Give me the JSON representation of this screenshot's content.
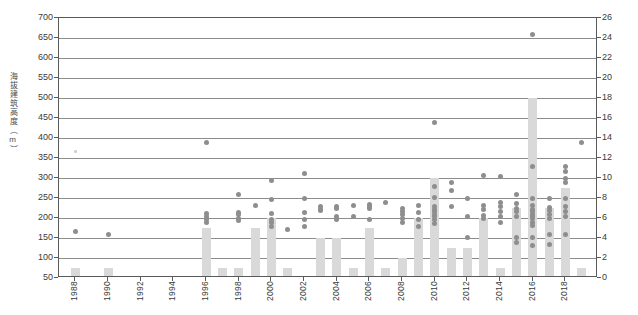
{
  "chart_data": {
    "type": "scatter",
    "title": "",
    "ylabel": "海拔建筑高度（m）",
    "ylabel_right": "",
    "xlabel": "",
    "ylim": [
      50,
      700
    ],
    "ytick_step": 50,
    "yticks": [
      50,
      100,
      150,
      200,
      250,
      300,
      350,
      400,
      450,
      500,
      550,
      600,
      650,
      700
    ],
    "ylim_right": [
      0,
      26
    ],
    "ytick_step_right": 2,
    "yticks_right": [
      0,
      2,
      4,
      6,
      8,
      10,
      12,
      14,
      16,
      18,
      20,
      22,
      24,
      26
    ],
    "xlim": [
      1987,
      2020
    ],
    "xticks": [
      1988,
      1990,
      1992,
      1994,
      1996,
      1998,
      2000,
      2002,
      2004,
      2006,
      2008,
      2010,
      2012,
      2014,
      2016,
      2018
    ],
    "grid": true,
    "legend": false,
    "bar_color": "#d9d9d9",
    "dot_color": "#8e8e8e",
    "series": [
      {
        "name": "建筑数量",
        "type": "bar",
        "axis": "right",
        "x": [
          1988,
          1990,
          1996,
          1997,
          1998,
          1999,
          2000,
          2001,
          2003,
          2004,
          2005,
          2006,
          2007,
          2008,
          2009,
          2010,
          2011,
          2012,
          2013,
          2014,
          2015,
          2016,
          2017,
          2018,
          2019
        ],
        "values": [
          1,
          1,
          5,
          1,
          1,
          5,
          6,
          1,
          4,
          4,
          1,
          5,
          1,
          2,
          6,
          10,
          3,
          3,
          6,
          1,
          7,
          18,
          7,
          9,
          1
        ]
      },
      {
        "name": "建筑高度",
        "type": "scatter",
        "axis": "left",
        "points": [
          [
            1988,
            166
          ],
          [
            1988,
            366
          ],
          [
            1990,
            160
          ],
          [
            1996,
            388
          ],
          [
            1996,
            212
          ],
          [
            1996,
            205
          ],
          [
            1996,
            196
          ],
          [
            1996,
            188
          ],
          [
            1998,
            260
          ],
          [
            1998,
            215
          ],
          [
            1998,
            208
          ],
          [
            1998,
            200
          ],
          [
            1998,
            193
          ],
          [
            1999,
            232
          ],
          [
            2000,
            295
          ],
          [
            2000,
            247
          ],
          [
            2000,
            212
          ],
          [
            2000,
            196
          ],
          [
            2000,
            188
          ],
          [
            2000,
            180
          ],
          [
            2001,
            172
          ],
          [
            2002,
            312
          ],
          [
            2002,
            248
          ],
          [
            2002,
            214
          ],
          [
            2002,
            196
          ],
          [
            2002,
            180
          ],
          [
            2003,
            228
          ],
          [
            2003,
            222
          ],
          [
            2003,
            218
          ],
          [
            2004,
            228
          ],
          [
            2004,
            224
          ],
          [
            2004,
            205
          ],
          [
            2004,
            196
          ],
          [
            2005,
            232
          ],
          [
            2005,
            205
          ],
          [
            2006,
            234
          ],
          [
            2006,
            228
          ],
          [
            2006,
            224
          ],
          [
            2006,
            196
          ],
          [
            2007,
            240
          ],
          [
            2008,
            225
          ],
          [
            2008,
            216
          ],
          [
            2008,
            210
          ],
          [
            2008,
            200
          ],
          [
            2008,
            188
          ],
          [
            2009,
            232
          ],
          [
            2009,
            214
          ],
          [
            2009,
            196
          ],
          [
            2009,
            178
          ],
          [
            2010,
            440
          ],
          [
            2010,
            280
          ],
          [
            2010,
            252
          ],
          [
            2010,
            228
          ],
          [
            2010,
            222
          ],
          [
            2010,
            216
          ],
          [
            2010,
            210
          ],
          [
            2010,
            204
          ],
          [
            2010,
            196
          ],
          [
            2010,
            186
          ],
          [
            2011,
            290
          ],
          [
            2011,
            268
          ],
          [
            2011,
            230
          ],
          [
            2012,
            250
          ],
          [
            2012,
            205
          ],
          [
            2012,
            152
          ],
          [
            2013,
            306
          ],
          [
            2013,
            232
          ],
          [
            2013,
            222
          ],
          [
            2013,
            206
          ],
          [
            2013,
            198
          ],
          [
            2014,
            304
          ],
          [
            2014,
            240
          ],
          [
            2014,
            228
          ],
          [
            2014,
            216
          ],
          [
            2014,
            205
          ],
          [
            2014,
            190
          ],
          [
            2015,
            258
          ],
          [
            2015,
            236
          ],
          [
            2015,
            224
          ],
          [
            2015,
            216
          ],
          [
            2015,
            205
          ],
          [
            2015,
            152
          ],
          [
            2015,
            140
          ],
          [
            2016,
            658
          ],
          [
            2016,
            330
          ],
          [
            2016,
            250
          ],
          [
            2016,
            232
          ],
          [
            2016,
            222
          ],
          [
            2016,
            216
          ],
          [
            2016,
            210
          ],
          [
            2016,
            204
          ],
          [
            2016,
            198
          ],
          [
            2016,
            190
          ],
          [
            2016,
            182
          ],
          [
            2016,
            152
          ],
          [
            2016,
            132
          ],
          [
            2017,
            248
          ],
          [
            2017,
            226
          ],
          [
            2017,
            218
          ],
          [
            2017,
            210
          ],
          [
            2017,
            200
          ],
          [
            2017,
            160
          ],
          [
            2017,
            134
          ],
          [
            2018,
            330
          ],
          [
            2018,
            316
          ],
          [
            2018,
            300
          ],
          [
            2018,
            288
          ],
          [
            2018,
            248
          ],
          [
            2018,
            228
          ],
          [
            2018,
            216
          ],
          [
            2018,
            204
          ],
          [
            2018,
            160
          ],
          [
            2019,
            388
          ]
        ]
      }
    ]
  }
}
